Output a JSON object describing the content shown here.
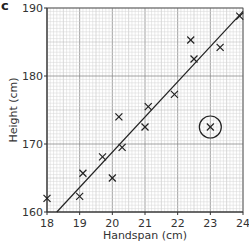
{
  "panel_label": "c",
  "chart_data": {
    "type": "scatter",
    "title": "",
    "xlabel": "Handspan (cm)",
    "ylabel": "Height (cm)",
    "xlim": [
      18,
      24
    ],
    "ylim": [
      160,
      190
    ],
    "xticks": [
      18,
      19,
      20,
      21,
      22,
      23,
      24
    ],
    "yticks": [
      160,
      170,
      180,
      190
    ],
    "grid": true,
    "legend": null,
    "points": [
      {
        "x": 18.0,
        "y": 162.0
      },
      {
        "x": 19.0,
        "y": 162.3
      },
      {
        "x": 19.1,
        "y": 165.7
      },
      {
        "x": 19.7,
        "y": 168.1
      },
      {
        "x": 20.0,
        "y": 165.0
      },
      {
        "x": 20.2,
        "y": 174.0
      },
      {
        "x": 20.3,
        "y": 169.5
      },
      {
        "x": 21.0,
        "y": 172.5
      },
      {
        "x": 21.1,
        "y": 175.5
      },
      {
        "x": 21.9,
        "y": 177.3
      },
      {
        "x": 22.4,
        "y": 185.3
      },
      {
        "x": 22.5,
        "y": 182.5
      },
      {
        "x": 23.0,
        "y": 172.5
      },
      {
        "x": 23.3,
        "y": 184.2
      },
      {
        "x": 23.9,
        "y": 188.8
      }
    ],
    "outlier": {
      "x": 23.0,
      "y": 172.5,
      "annotation": "circled"
    },
    "line_of_best_fit": {
      "x1": 18.3,
      "y1": 160.0,
      "x2": 24.0,
      "y2": 189.5
    }
  }
}
